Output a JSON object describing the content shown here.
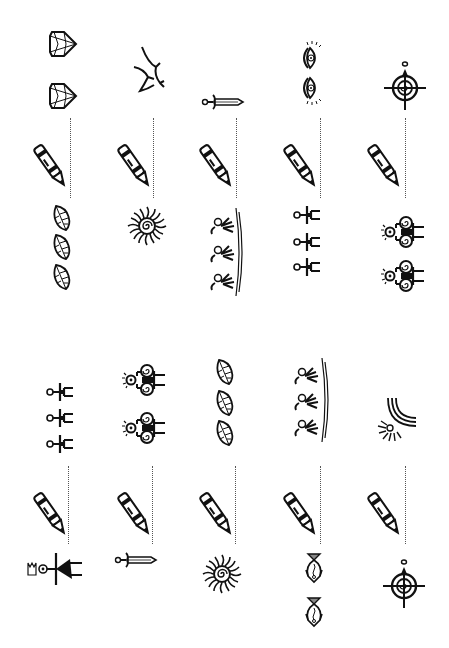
{
  "worksheet": {
    "type": "pattern-completion",
    "orientation": "rotated-90",
    "sections": [
      {
        "id": "top",
        "columns": [
          {
            "index": 1,
            "before": [
              "diamond",
              "diamond"
            ],
            "after": [
              "leaf",
              "leaf",
              "leaf"
            ]
          },
          {
            "index": 2,
            "before": [
              "dragon"
            ],
            "after": [
              "sun-spiral"
            ]
          },
          {
            "index": 3,
            "before": [
              "sword"
            ],
            "after": [
              "dancers-wave"
            ]
          },
          {
            "index": 4,
            "before": [
              "eye-spiral",
              "eye-spiral"
            ],
            "after": [
              "stick-figure",
              "stick-figure",
              "stick-figure"
            ]
          },
          {
            "index": 5,
            "before": [
              "target-arrow"
            ],
            "after": [
              "spiral-figure",
              "spiral-figure"
            ]
          }
        ]
      },
      {
        "id": "bottom",
        "columns": [
          {
            "index": 1,
            "before": [
              "stick-figure",
              "stick-figure",
              "stick-figure"
            ],
            "after": [
              "crown-figure"
            ]
          },
          {
            "index": 2,
            "before": [
              "spiral-figure",
              "spiral-figure"
            ],
            "after": [
              "sword"
            ]
          },
          {
            "index": 3,
            "before": [
              "leaf",
              "leaf",
              "leaf"
            ],
            "after": [
              "sun-spiral"
            ]
          },
          {
            "index": 4,
            "before": [
              "dancers-wave"
            ],
            "after": [
              "fish",
              "fish"
            ]
          },
          {
            "index": 5,
            "before": [
              "rainbow-sun"
            ],
            "after": [
              "target-arrow"
            ]
          }
        ]
      }
    ]
  },
  "icons": {
    "pencil": "pencil-icon",
    "diamond": "diamond-icon",
    "dragon": "dragon-icon",
    "sword": "sword-icon",
    "eye": "eye-icon",
    "target": "target-icon",
    "leaf": "leaf-icon",
    "sun": "sun-icon",
    "dancers": "dancers-icon",
    "stick_figure": "stick-figure-icon",
    "spiral_figure": "spiral-figure-icon",
    "crown_figure": "crown-figure-icon",
    "fish": "fish-icon",
    "rainbow_sun": "rainbow-sun-icon"
  },
  "colors": {
    "ink": "#111111",
    "background": "#ffffff",
    "dotted_line": "#555555"
  }
}
